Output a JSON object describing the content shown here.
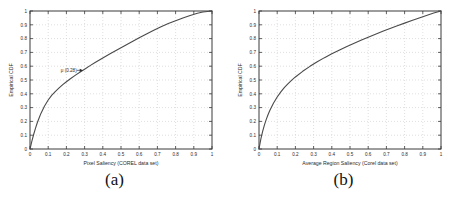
{
  "figure": {
    "background": "#ffffff",
    "curve_color": "#4a4a4a",
    "grid_color": "#c9c9c9",
    "axis_color": "#3a3a3a"
  },
  "panels": [
    {
      "caption": "(a)",
      "chart_data": {
        "type": "line",
        "title": "",
        "xlabel": "Pixel Saliency (COREL data set)",
        "ylabel": "Empirical CDF",
        "xlim": [
          0,
          1
        ],
        "ylim": [
          0,
          1
        ],
        "grid": true,
        "legend": "none",
        "xticks": [
          0,
          0.1,
          0.2,
          0.3,
          0.4,
          0.5,
          0.6,
          0.7,
          0.8,
          0.9,
          1
        ],
        "xticklabels": [
          "0",
          "0.1",
          "0.2",
          "0.3",
          "0.4",
          "0.5",
          "0.6",
          "0.7",
          "0.8",
          "0.9",
          "1"
        ],
        "yticks": [
          0,
          0.1,
          0.2,
          0.3,
          0.4,
          0.5,
          0.6,
          0.7,
          0.8,
          0.9,
          1
        ],
        "yticklabels": [
          "0",
          "0.1",
          "0.2",
          "0.3",
          "0.4",
          "0.5",
          "0.6",
          "0.7",
          "0.8",
          "0.9",
          "1"
        ],
        "series": [
          {
            "name": "Empirical CDF of pixel saliency",
            "x": [
              0,
              0.01,
              0.02,
              0.03,
              0.04,
              0.05,
              0.06,
              0.08,
              0.1,
              0.12,
              0.14,
              0.16,
              0.18,
              0.2,
              0.22,
              0.25,
              0.28,
              0.3,
              0.33,
              0.36,
              0.4,
              0.44,
              0.48,
              0.52,
              0.56,
              0.6,
              0.64,
              0.68,
              0.72,
              0.76,
              0.8,
              0.84,
              0.88,
              0.92,
              0.95,
              1.0
            ],
            "y": [
              0.0,
              0.055,
              0.105,
              0.15,
              0.19,
              0.225,
              0.258,
              0.312,
              0.355,
              0.39,
              0.418,
              0.443,
              0.466,
              0.487,
              0.507,
              0.535,
              0.562,
              0.578,
              0.604,
              0.628,
              0.66,
              0.69,
              0.719,
              0.748,
              0.777,
              0.806,
              0.834,
              0.861,
              0.886,
              0.909,
              0.93,
              0.95,
              0.968,
              0.984,
              0.993,
              1.0
            ]
          }
        ],
        "annotations": [
          {
            "text": "μ (0.28)",
            "x": 0.29,
            "y": 0.57,
            "arrow": "points-right-to-curve"
          }
        ]
      }
    },
    {
      "caption": "(b)",
      "chart_data": {
        "type": "line",
        "title": "",
        "xlabel": "Average Region Saliency (Corel data set)",
        "ylabel": "Empirical CDF",
        "xlim": [
          0,
          1
        ],
        "ylim": [
          0,
          1
        ],
        "grid": true,
        "legend": "none",
        "xticks": [
          0,
          0.1,
          0.2,
          0.3,
          0.4,
          0.5,
          0.6,
          0.7,
          0.8,
          0.9,
          1
        ],
        "xticklabels": [
          "0",
          "0.1",
          "0.2",
          "0.3",
          "0.4",
          "0.5",
          "0.6",
          "0.7",
          "0.8",
          "0.9",
          "1"
        ],
        "yticks": [
          0,
          0.1,
          0.2,
          0.3,
          0.4,
          0.5,
          0.6,
          0.7,
          0.8,
          0.9,
          1
        ],
        "yticklabels": [
          "0",
          "0.1",
          "0.2",
          "0.3",
          "0.4",
          "0.5",
          "0.6",
          "0.7",
          "0.8",
          "0.9",
          "1"
        ],
        "series": [
          {
            "name": "Empirical CDF of average region saliency",
            "x": [
              0,
              0.01,
              0.02,
              0.03,
              0.04,
              0.05,
              0.06,
              0.08,
              0.1,
              0.12,
              0.14,
              0.16,
              0.18,
              0.2,
              0.24,
              0.28,
              0.32,
              0.36,
              0.4,
              0.44,
              0.48,
              0.52,
              0.56,
              0.6,
              0.64,
              0.68,
              0.72,
              0.76,
              0.8,
              0.84,
              0.88,
              0.92,
              0.96,
              1.0
            ],
            "y": [
              0.0,
              0.072,
              0.128,
              0.175,
              0.215,
              0.25,
              0.281,
              0.333,
              0.377,
              0.414,
              0.446,
              0.474,
              0.499,
              0.522,
              0.563,
              0.599,
              0.632,
              0.662,
              0.69,
              0.716,
              0.741,
              0.765,
              0.788,
              0.81,
              0.832,
              0.853,
              0.873,
              0.893,
              0.912,
              0.931,
              0.95,
              0.968,
              0.986,
              1.0
            ]
          }
        ],
        "annotations": []
      }
    }
  ]
}
